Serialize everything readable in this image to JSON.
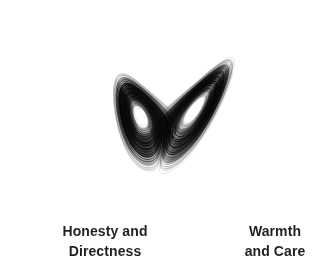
{
  "canvas": {
    "width": 335,
    "height": 274,
    "background_color": "#ffffff"
  },
  "figure": {
    "name": "lorenz-attractor",
    "stroke_color": "#000000",
    "stroke_light_color": "#9a9a9a",
    "line_width": 0.35,
    "opacity": 0.5
  },
  "labels": {
    "left": {
      "text": "Honesty and\nDirectness",
      "line1": "Honesty and",
      "line2": "Directness",
      "color": "#1f2023",
      "font_size": 14,
      "align": "center"
    },
    "right": {
      "text": "Warmth\nand Care",
      "line1": "Warmth",
      "line2": "and Care",
      "color": "#1f2023",
      "font_size": 14,
      "align": "center"
    }
  },
  "chart_data": {
    "type": "line",
    "title": "",
    "subtitle": "",
    "xlabel": "",
    "ylabel": "",
    "grid": false,
    "legend": "none",
    "system": "lorenz",
    "equations": {
      "dx": "sigma * (y - x)",
      "dy": "x * (rho - z) - y",
      "dz": "x * y - beta * z"
    },
    "parameters": {
      "sigma": 10,
      "rho": 28,
      "beta": 2.6666666667
    },
    "integration": {
      "method": "rk4",
      "dt": 0.0038,
      "steps": 24000,
      "initial_state": [
        0.92,
        1.35,
        21.4
      ]
    },
    "projection": {
      "note": "3D state projected to 2D image plane; left lobe upright, right lobe tilted",
      "rotation_deg": -22,
      "scale_x": 3.45,
      "scale_y": 2.62,
      "shear": 0.46,
      "origin_x": 167,
      "origin_y": 116
    },
    "annotations": [
      {
        "text": "Honesty and Directness",
        "lobe": "left",
        "x": 105,
        "y": 241
      },
      {
        "text": "Warmth and Care",
        "lobe": "right",
        "x": 275,
        "y": 241
      }
    ],
    "lobes": [
      {
        "name": "left",
        "label": "Honesty and Directness",
        "center_x": 110,
        "center_y": 120,
        "radius_x": 86,
        "radius_y": 100,
        "tilt_deg": 8,
        "hole_radius_x": 36,
        "hole_radius_y": 28
      },
      {
        "name": "right",
        "label": "Warmth and Care",
        "center_x": 253,
        "center_y": 116,
        "radius_x": 72,
        "radius_y": 40,
        "tilt_deg": -31,
        "hole_radius_x": 30,
        "hole_radius_y": 11
      }
    ],
    "crossing_point": {
      "x": 182,
      "y": 132
    },
    "bounds": {
      "x_min": 19,
      "x_max": 322,
      "y_min": 13,
      "y_max": 213
    }
  }
}
